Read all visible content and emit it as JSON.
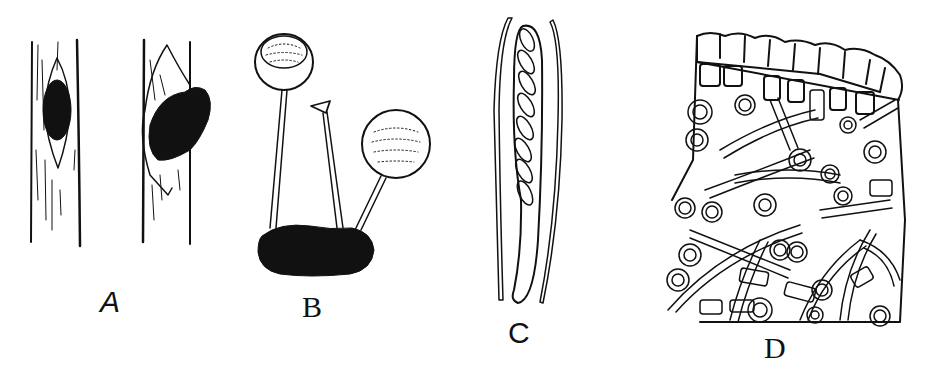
{
  "figure": {
    "panels": [
      {
        "id": "A",
        "label": "A",
        "subject": "stem-with-lesions"
      },
      {
        "id": "B",
        "label": "B",
        "subject": "stalked-apothecia-on-sclerotium"
      },
      {
        "id": "C",
        "label": "C",
        "subject": "ascus-with-ascospores-and-paraphyses"
      },
      {
        "id": "D",
        "label": "D",
        "subject": "cellular-tissue-section"
      }
    ],
    "ink_color": "#111111",
    "background": "#ffffff"
  }
}
